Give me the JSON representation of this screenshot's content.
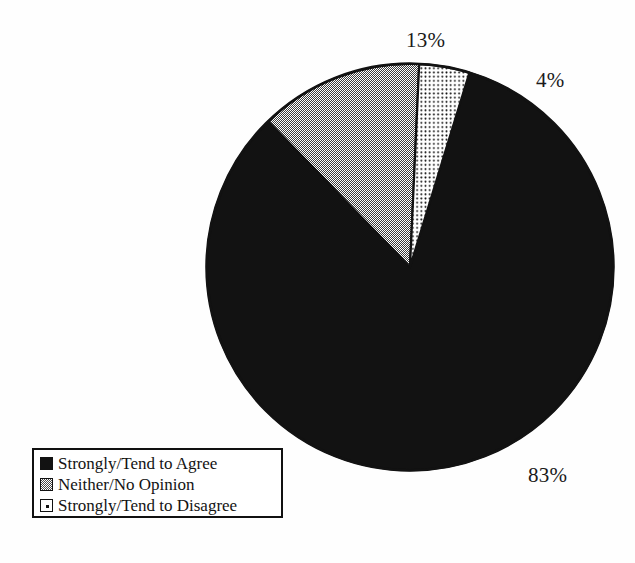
{
  "chart_data": {
    "type": "pie",
    "title": "",
    "categories": [
      "Strongly/Tend to Agree",
      "Neither/No Opinion",
      "Strongly/Tend to Disagree"
    ],
    "values": [
      83,
      13,
      4
    ],
    "value_labels": [
      "83%",
      "13%",
      "4%"
    ],
    "unit": "percent",
    "legend_position": "bottom-left",
    "grid": false,
    "slices": [
      {
        "label": "Strongly/Tend to Agree",
        "value": 83,
        "display": "83%",
        "fill": "solid-black",
        "color": "#121212",
        "start_angle": 17.0,
        "end_angle": 315.8
      },
      {
        "label": "Neither/No Opinion",
        "value": 13,
        "display": "13%",
        "fill": "gray-checker",
        "color": "#8c8c8c",
        "start_angle": 315.8,
        "end_angle": 362.6
      },
      {
        "label": "Strongly/Tend to Disagree",
        "value": 4,
        "display": "4%",
        "fill": "white-dotted",
        "color": "#ffffff",
        "start_angle": 362.6,
        "end_angle": 377.0
      }
    ]
  },
  "labels": {
    "pct_agree": "83%",
    "pct_neither": "13%",
    "pct_disagree": "4%"
  },
  "legend": {
    "items": [
      {
        "label": "Strongly/Tend to Agree",
        "swatch": "solid-black-swatch"
      },
      {
        "label": "Neither/No Opinion",
        "swatch": "gray-checker-swatch"
      },
      {
        "label": "Strongly/Tend to Disagree",
        "swatch": "white-dotted-swatch"
      }
    ]
  },
  "colors": {
    "background": "#fefefe",
    "ink": "#121212",
    "gray_fill": "#8c8c8c",
    "outline": "#111111"
  }
}
